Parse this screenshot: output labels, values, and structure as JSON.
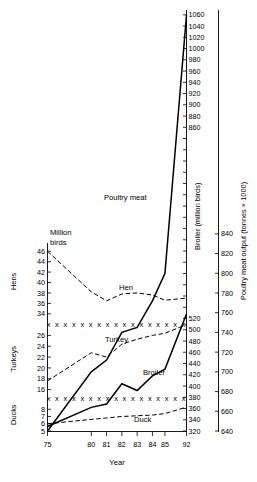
{
  "chart_data": {
    "type": "line",
    "title": "",
    "xlabel": "Year",
    "unit_note": "Million birds",
    "x_tick_labels": [
      "75",
      "80",
      "81",
      "82",
      "83",
      "84",
      "85",
      "92"
    ],
    "x_tick_values": [
      75,
      80,
      81,
      82,
      83,
      84,
      85,
      92
    ],
    "axes": [
      {
        "id": "hens",
        "side": "left",
        "title": "Hens",
        "ticks": [
          34,
          36,
          38,
          40,
          42,
          44,
          46
        ],
        "range": [
          33,
          47
        ]
      },
      {
        "id": "turkeys",
        "side": "left",
        "title": "Turkeys",
        "ticks": [
          16,
          18,
          20,
          22,
          24,
          26
        ],
        "range": [
          15,
          27
        ]
      },
      {
        "id": "ducks",
        "side": "left",
        "title": "Ducks",
        "ticks": [
          5,
          6,
          7,
          8
        ],
        "range": [
          5,
          9
        ]
      },
      {
        "id": "broiler",
        "side": "right",
        "title": "Broiler (million birds)",
        "ticks": [
          320,
          340,
          360,
          380,
          400,
          420,
          440,
          460,
          480,
          500,
          520,
          540,
          560,
          580,
          600,
          620,
          640,
          660,
          680,
          700,
          720,
          740,
          760,
          780,
          800,
          820,
          840,
          860,
          880,
          900,
          920,
          940,
          960,
          980,
          1000,
          1020,
          1040,
          1060
        ],
        "labelled_ticks": [
          320,
          340,
          360,
          380,
          400,
          420,
          440,
          460,
          480,
          500,
          520,
          860,
          880,
          900,
          920,
          940,
          960,
          980,
          1000,
          1020,
          1040,
          1060
        ],
        "range": [
          320,
          1060
        ]
      },
      {
        "id": "poultry_meat",
        "side": "right",
        "title": "Poultry meat output (tonnes × 1000)",
        "ticks": [
          640,
          660,
          680,
          700,
          720,
          740,
          760,
          780,
          800,
          820,
          840
        ],
        "range": [
          640,
          850
        ]
      }
    ],
    "series": [
      {
        "name": "Poultry meat",
        "label": "Poultry meat",
        "style": "solid",
        "axis": "poultry_meat",
        "x": [
          75,
          80,
          81,
          82,
          83,
          84,
          85,
          92
        ],
        "values": [
          640,
          700,
          712,
          740,
          745,
          772,
          800,
          1062
        ]
      },
      {
        "name": "Hen",
        "label": "Hen",
        "style": "dashed",
        "axis": "hens",
        "x": [
          75,
          80,
          81,
          82,
          83,
          84,
          85,
          92
        ],
        "values": [
          46.0,
          38.2,
          36.5,
          37.8,
          38.0,
          37.6,
          36.6,
          37.0
        ]
      },
      {
        "name": "Turkey",
        "label": "Turkey",
        "style": "dashed",
        "axis": "turkeys",
        "x": [
          75,
          80,
          81,
          82,
          83,
          84,
          85,
          92
        ],
        "values": [
          17.6,
          22.8,
          22.0,
          24.4,
          25.3,
          26.0,
          26.4,
          28.0
        ]
      },
      {
        "name": "Broiler",
        "label": "Broiler",
        "style": "solid",
        "axis": "broiler",
        "x": [
          75,
          80,
          81,
          82,
          83,
          84,
          85,
          92
        ],
        "values": [
          328,
          362,
          368,
          404,
          392,
          418,
          430,
          528
        ]
      },
      {
        "name": "Duck",
        "label": "Duck",
        "style": "dashed",
        "axis": "ducks",
        "x": [
          75,
          80,
          81,
          82,
          83,
          84,
          85,
          92
        ],
        "values": [
          6.0,
          6.6,
          6.8,
          7.0,
          7.1,
          7.2,
          7.4,
          8.3
        ]
      }
    ],
    "break_markers": {
      "symbol": "x",
      "rows": [
        {
          "axis_gap": "hens-turkeys",
          "note": "axis break row between 34 and 26"
        },
        {
          "axis_gap": "turkeys-ducks",
          "note": "axis break row between 16 and 8"
        }
      ]
    },
    "grid": false,
    "legend": "inline-labels"
  }
}
